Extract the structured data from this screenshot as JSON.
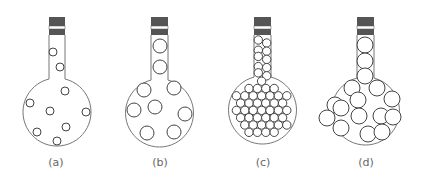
{
  "diagram": {
    "colors": {
      "cap": "#555555",
      "stroke": "#444444",
      "outline": "#777777",
      "label": "#666666"
    },
    "flasks": [
      {
        "id": "a",
        "label": "(a)",
        "cx": 57,
        "bulb_cy": 112,
        "bulb_r": 34,
        "neck_left": 49,
        "neck_right": 65,
        "particles": [
          {
            "x": 53,
            "y": 52,
            "r": 4
          },
          {
            "x": 60,
            "y": 67,
            "r": 4
          },
          {
            "x": 65,
            "y": 91,
            "r": 4
          },
          {
            "x": 30,
            "y": 103,
            "r": 4
          },
          {
            "x": 50,
            "y": 111,
            "r": 4
          },
          {
            "x": 86,
            "y": 112,
            "r": 4
          },
          {
            "x": 37,
            "y": 132,
            "r": 4
          },
          {
            "x": 66,
            "y": 127,
            "r": 4
          },
          {
            "x": 57,
            "y": 141,
            "r": 4
          }
        ]
      },
      {
        "id": "b",
        "label": "(b)",
        "cx": 160,
        "bulb_cy": 113,
        "bulb_r": 34,
        "neck_left": 151,
        "neck_right": 168,
        "particles": [
          {
            "x": 160,
            "y": 46,
            "r": 7
          },
          {
            "x": 160,
            "y": 67,
            "r": 7
          },
          {
            "x": 144,
            "y": 90,
            "r": 7
          },
          {
            "x": 174,
            "y": 88,
            "r": 7
          },
          {
            "x": 134,
            "y": 110,
            "r": 7
          },
          {
            "x": 155,
            "y": 107,
            "r": 7
          },
          {
            "x": 185,
            "y": 114,
            "r": 7
          },
          {
            "x": 147,
            "y": 133,
            "r": 7
          },
          {
            "x": 174,
            "y": 132,
            "r": 7
          }
        ]
      },
      {
        "id": "c",
        "label": "(c)",
        "cx": 262,
        "bulb_cy": 110,
        "bulb_r": 34,
        "neck_left": 254,
        "neck_right": 271,
        "particles": "dense"
      },
      {
        "id": "d",
        "label": "(d)",
        "cx": 365,
        "bulb_cy": 111,
        "bulb_r": 34,
        "neck_left": 357,
        "neck_right": 374,
        "particles": [
          {
            "x": 365,
            "y": 45,
            "r": 8
          },
          {
            "x": 365,
            "y": 61,
            "r": 8
          },
          {
            "x": 365,
            "y": 76,
            "r": 8
          },
          {
            "x": 352,
            "y": 88,
            "r": 8
          },
          {
            "x": 377,
            "y": 88,
            "r": 8
          },
          {
            "x": 335,
            "y": 105,
            "r": 8
          },
          {
            "x": 358,
            "y": 100,
            "r": 8
          },
          {
            "x": 392,
            "y": 99,
            "r": 8
          },
          {
            "x": 341,
            "y": 108,
            "r": 8
          },
          {
            "x": 327,
            "y": 118,
            "r": 8
          },
          {
            "x": 359,
            "y": 116,
            "r": 8
          },
          {
            "x": 381,
            "y": 116,
            "r": 8
          },
          {
            "x": 393,
            "y": 117,
            "r": 8
          },
          {
            "x": 341,
            "y": 128,
            "r": 8
          },
          {
            "x": 368,
            "y": 134,
            "r": 8
          },
          {
            "x": 382,
            "y": 132,
            "r": 8
          }
        ]
      }
    ]
  }
}
